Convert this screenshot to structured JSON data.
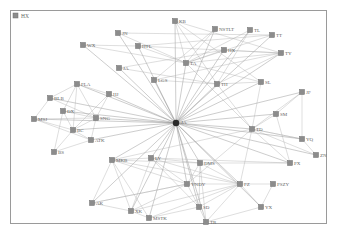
{
  "diagram": {
    "type": "network-graph",
    "legend": {
      "label": "HX",
      "x": 14,
      "y": 15
    },
    "colors": {
      "node_fill": "#8c8c8c",
      "node_stroke": "#6e6e6e",
      "edge": "#a8a8a8",
      "hub": "#2a2a2a",
      "frame": "#9a9a9a",
      "label": "#666666"
    },
    "hub": {
      "id": "hub",
      "label": "JA",
      "x": 176,
      "y": 123
    },
    "nodes": [
      {
        "id": "KB",
        "label": "KB",
        "x": 175,
        "y": 21
      },
      {
        "id": "NSTLT",
        "label": "NSTLT",
        "x": 215,
        "y": 29
      },
      {
        "id": "TL",
        "label": "TL",
        "x": 250,
        "y": 30
      },
      {
        "id": "TT",
        "label": "TT",
        "x": 272,
        "y": 35
      },
      {
        "id": "WX",
        "label": "WX",
        "x": 83,
        "y": 45
      },
      {
        "id": "JN",
        "label": "JN",
        "x": 118,
        "y": 33
      },
      {
        "id": "HTL",
        "label": "HTL",
        "x": 138,
        "y": 46
      },
      {
        "id": "HX2",
        "label": "HX",
        "x": 224,
        "y": 50
      },
      {
        "id": "TY",
        "label": "TY",
        "x": 281,
        "y": 53
      },
      {
        "id": "JA2",
        "label": "JA",
        "x": 119,
        "y": 68
      },
      {
        "id": "TA",
        "label": "TA",
        "x": 186,
        "y": 63
      },
      {
        "id": "LGS",
        "label": "LGS",
        "x": 154,
        "y": 80
      },
      {
        "id": "SL",
        "label": "SL",
        "x": 261,
        "y": 82
      },
      {
        "id": "TH",
        "label": "TH",
        "x": 217,
        "y": 84
      },
      {
        "id": "FLA",
        "label": "FLA",
        "x": 77,
        "y": 84
      },
      {
        "id": "HJ",
        "label": "HJ",
        "x": 109,
        "y": 94
      },
      {
        "id": "BLB",
        "label": "BLB",
        "x": 50,
        "y": 98
      },
      {
        "id": "DX",
        "label": "DX",
        "x": 63,
        "y": 111
      },
      {
        "id": "MSJ",
        "label": "MSJ",
        "x": 34,
        "y": 119
      },
      {
        "id": "SNG",
        "label": "SNG",
        "x": 96,
        "y": 118
      },
      {
        "id": "BC",
        "label": "BC",
        "x": 73,
        "y": 130
      },
      {
        "id": "ATK",
        "label": "ATK",
        "x": 91,
        "y": 140
      },
      {
        "id": "BS",
        "label": "BS",
        "x": 54,
        "y": 152
      },
      {
        "id": "JF",
        "label": "JF",
        "x": 302,
        "y": 92
      },
      {
        "id": "SM",
        "label": "SM",
        "x": 276,
        "y": 114
      },
      {
        "id": "TD",
        "label": "TD",
        "x": 252,
        "y": 129
      },
      {
        "id": "YQ",
        "label": "YQ",
        "x": 302,
        "y": 139
      },
      {
        "id": "ZN",
        "label": "ZN",
        "x": 316,
        "y": 155
      },
      {
        "id": "PX",
        "label": "PX",
        "x": 290,
        "y": 163
      },
      {
        "id": "MKB",
        "label": "MKB",
        "x": 112,
        "y": 160
      },
      {
        "id": "LY",
        "label": "LY",
        "x": 151,
        "y": 158
      },
      {
        "id": "DMS",
        "label": "DMS",
        "x": 200,
        "y": 163
      },
      {
        "id": "YNDY",
        "label": "YNDY",
        "x": 187,
        "y": 184
      },
      {
        "id": "FZ",
        "label": "FZ",
        "x": 240,
        "y": 184
      },
      {
        "id": "PSZY",
        "label": "PSZY",
        "x": 273,
        "y": 184
      },
      {
        "id": "AK",
        "label": "AK",
        "x": 92,
        "y": 203
      },
      {
        "id": "XK",
        "label": "XK",
        "x": 131,
        "y": 211
      },
      {
        "id": "MSTK",
        "label": "MSTK",
        "x": 149,
        "y": 218
      },
      {
        "id": "SD",
        "label": "SD",
        "x": 199,
        "y": 207
      },
      {
        "id": "YX",
        "label": "YX",
        "x": 261,
        "y": 207
      },
      {
        "id": "TR",
        "label": "TR",
        "x": 206,
        "y": 222
      }
    ],
    "edges": [
      [
        "hub",
        "KB"
      ],
      [
        "hub",
        "NSTLT"
      ],
      [
        "hub",
        "TL"
      ],
      [
        "hub",
        "TT"
      ],
      [
        "hub",
        "WX"
      ],
      [
        "hub",
        "JN"
      ],
      [
        "hub",
        "HTL"
      ],
      [
        "hub",
        "HX2"
      ],
      [
        "hub",
        "TY"
      ],
      [
        "hub",
        "JA2"
      ],
      [
        "hub",
        "TA"
      ],
      [
        "hub",
        "LGS"
      ],
      [
        "hub",
        "SL"
      ],
      [
        "hub",
        "TH"
      ],
      [
        "hub",
        "FLA"
      ],
      [
        "hub",
        "HJ"
      ],
      [
        "hub",
        "BLB"
      ],
      [
        "hub",
        "DX"
      ],
      [
        "hub",
        "MSJ"
      ],
      [
        "hub",
        "SNG"
      ],
      [
        "hub",
        "BC"
      ],
      [
        "hub",
        "ATK"
      ],
      [
        "hub",
        "JF"
      ],
      [
        "hub",
        "SM"
      ],
      [
        "hub",
        "TD"
      ],
      [
        "hub",
        "YQ"
      ],
      [
        "hub",
        "ZN"
      ],
      [
        "hub",
        "PX"
      ],
      [
        "hub",
        "MKB"
      ],
      [
        "hub",
        "LY"
      ],
      [
        "hub",
        "DMS"
      ],
      [
        "hub",
        "YNDY"
      ],
      [
        "hub",
        "FZ"
      ],
      [
        "hub",
        "AK"
      ],
      [
        "hub",
        "XK"
      ],
      [
        "hub",
        "MSTK"
      ],
      [
        "hub",
        "SD"
      ],
      [
        "hub",
        "TR"
      ],
      [
        "hub",
        "YX"
      ],
      [
        "WX",
        "TA"
      ],
      [
        "WX",
        "HTL"
      ],
      [
        "JN",
        "TT"
      ],
      [
        "JN",
        "TA"
      ],
      [
        "HTL",
        "TY"
      ],
      [
        "HTL",
        "TT"
      ],
      [
        "HTL",
        "TA"
      ],
      [
        "KB",
        "TA"
      ],
      [
        "KB",
        "TY"
      ],
      [
        "KB",
        "TH"
      ],
      [
        "KB",
        "SL"
      ],
      [
        "NSTLT",
        "LGS"
      ],
      [
        "NSTLT",
        "TA"
      ],
      [
        "TL",
        "TA"
      ],
      [
        "TL",
        "TH"
      ],
      [
        "TT",
        "TA"
      ],
      [
        "HX2",
        "TA"
      ],
      [
        "HX2",
        "TY"
      ],
      [
        "TY",
        "TA"
      ],
      [
        "TY",
        "TH"
      ],
      [
        "TY",
        "LGS"
      ],
      [
        "JA2",
        "TH"
      ],
      [
        "JA2",
        "HX2"
      ],
      [
        "TA",
        "TD"
      ],
      [
        "TA",
        "SL"
      ],
      [
        "LGS",
        "TH"
      ],
      [
        "SL",
        "TH"
      ],
      [
        "TH",
        "TD"
      ],
      [
        "SL",
        "TD"
      ],
      [
        "FLA",
        "BLB"
      ],
      [
        "FLA",
        "DX"
      ],
      [
        "FLA",
        "HJ"
      ],
      [
        "FLA",
        "BC"
      ],
      [
        "FLA",
        "SNG"
      ],
      [
        "BLB",
        "MSJ"
      ],
      [
        "BLB",
        "SNG"
      ],
      [
        "DX",
        "BC"
      ],
      [
        "DX",
        "SNG"
      ],
      [
        "MSJ",
        "SNG"
      ],
      [
        "MSJ",
        "BC"
      ],
      [
        "MSJ",
        "ATK"
      ],
      [
        "SNG",
        "BC"
      ],
      [
        "SNG",
        "ATK"
      ],
      [
        "BC",
        "BS"
      ],
      [
        "BC",
        "ATK"
      ],
      [
        "HJ",
        "SNG"
      ],
      [
        "HJ",
        "BC"
      ],
      [
        "BS",
        "ATK"
      ],
      [
        "DX",
        "BS"
      ],
      [
        "JF",
        "SM"
      ],
      [
        "JF",
        "YQ"
      ],
      [
        "JF",
        "TD"
      ],
      [
        "SM",
        "TD"
      ],
      [
        "SM",
        "PX"
      ],
      [
        "TD",
        "YQ"
      ],
      [
        "TD",
        "ZN"
      ],
      [
        "TD",
        "PX"
      ],
      [
        "YQ",
        "ZN"
      ],
      [
        "YQ",
        "TD"
      ],
      [
        "MKB",
        "LY"
      ],
      [
        "MKB",
        "DMS"
      ],
      [
        "MKB",
        "YNDY"
      ],
      [
        "MKB",
        "AK"
      ],
      [
        "MKB",
        "XK"
      ],
      [
        "MKB",
        "MSTK"
      ],
      [
        "MKB",
        "FZ"
      ],
      [
        "LY",
        "DMS"
      ],
      [
        "LY",
        "YNDY"
      ],
      [
        "LY",
        "FZ"
      ],
      [
        "LY",
        "XK"
      ],
      [
        "LY",
        "SD"
      ],
      [
        "DMS",
        "YNDY"
      ],
      [
        "DMS",
        "FZ"
      ],
      [
        "DMS",
        "SD"
      ],
      [
        "DMS",
        "TR"
      ],
      [
        "YNDY",
        "FZ"
      ],
      [
        "YNDY",
        "SD"
      ],
      [
        "YNDY",
        "AK"
      ],
      [
        "YNDY",
        "XK"
      ],
      [
        "FZ",
        "PSZY"
      ],
      [
        "FZ",
        "SD"
      ],
      [
        "FZ",
        "YX"
      ],
      [
        "FZ",
        "TR"
      ],
      [
        "FZ",
        "XK"
      ],
      [
        "PSZY",
        "YX"
      ],
      [
        "AK",
        "XK"
      ],
      [
        "AK",
        "YNDY"
      ],
      [
        "XK",
        "MSTK"
      ],
      [
        "MSTK",
        "SD"
      ],
      [
        "MSTK",
        "FZ"
      ],
      [
        "SD",
        "TR"
      ],
      [
        "TR",
        "YX"
      ],
      [
        "YNDY",
        "TD"
      ],
      [
        "FZ",
        "TD"
      ],
      [
        "DMS",
        "PX"
      ],
      [
        "LY",
        "PX"
      ],
      [
        "MKB",
        "TD"
      ]
    ]
  }
}
